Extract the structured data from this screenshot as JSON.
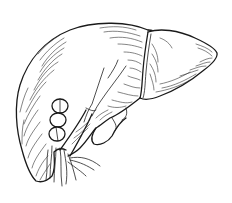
{
  "illustration": {
    "subject": "liver",
    "style": "black ink line drawing with hatching",
    "background": "#ffffff",
    "ink_color": "#1a1a1a",
    "parts": [
      "right-lobe",
      "left-lobe",
      "falciform-ligament",
      "gallbladder",
      "portal-vessels",
      "hepatic-duct"
    ]
  }
}
